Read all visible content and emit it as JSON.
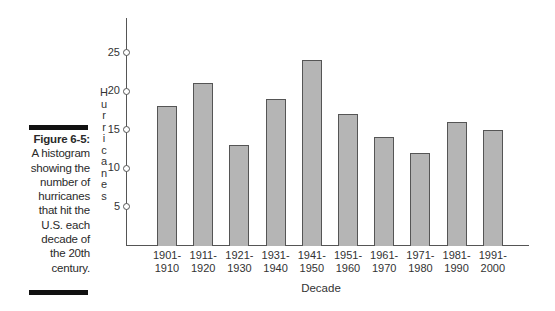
{
  "caption": {
    "figure_label": "Figure 6-5:",
    "text_lines": [
      "A histogram",
      "showing the",
      "number of",
      "hurricanes",
      "that hit the",
      "U.S. each",
      "decade of",
      "the 20th",
      "century."
    ]
  },
  "chart_data": {
    "type": "bar",
    "title": "",
    "xlabel": "Decade",
    "ylabel": "Hurricanes",
    "categories": [
      "1901-1910",
      "1911-1920",
      "1921-1930",
      "1931-1940",
      "1941-1950",
      "1951-1960",
      "1961-1970",
      "1971-1980",
      "1981-1990",
      "1991-2000"
    ],
    "category_lines": [
      [
        "1901-",
        "1910"
      ],
      [
        "1911-",
        "1920"
      ],
      [
        "1921-",
        "1930"
      ],
      [
        "1931-",
        "1940"
      ],
      [
        "1941-",
        "1950"
      ],
      [
        "1951-",
        "1960"
      ],
      [
        "1961-",
        "1970"
      ],
      [
        "1971-",
        "1980"
      ],
      [
        "1981-",
        "1990"
      ],
      [
        "1991-",
        "2000"
      ]
    ],
    "values": [
      18,
      21,
      13,
      19,
      24,
      17,
      14,
      12,
      16,
      15
    ],
    "yticks": [
      5,
      10,
      15,
      20,
      25
    ],
    "ylim": [
      0,
      28
    ],
    "grid": false,
    "legend": null,
    "bar_color": "#b5b5b5",
    "bar_edge_color": "#555555"
  }
}
